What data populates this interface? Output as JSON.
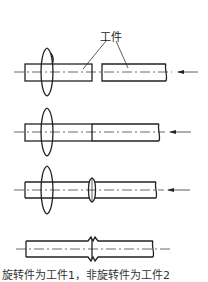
{
  "diagram": {
    "label": "工件",
    "caption": "旋转件为工件1，非旋转件为工件2",
    "stages": [
      {
        "name": "stage-1-separate",
        "description": "Rotating workpiece and stationary workpiece apart, axial force arrow"
      },
      {
        "name": "stage-2-contact",
        "description": "Workpieces in contact under rotation and axial force"
      },
      {
        "name": "stage-3-upset",
        "description": "Flash forming at interface during rotation"
      },
      {
        "name": "stage-4-welded",
        "description": "Completed weld with flash, rotation stopped"
      }
    ],
    "colors": {
      "line": "#222222",
      "background": "#ffffff"
    }
  }
}
